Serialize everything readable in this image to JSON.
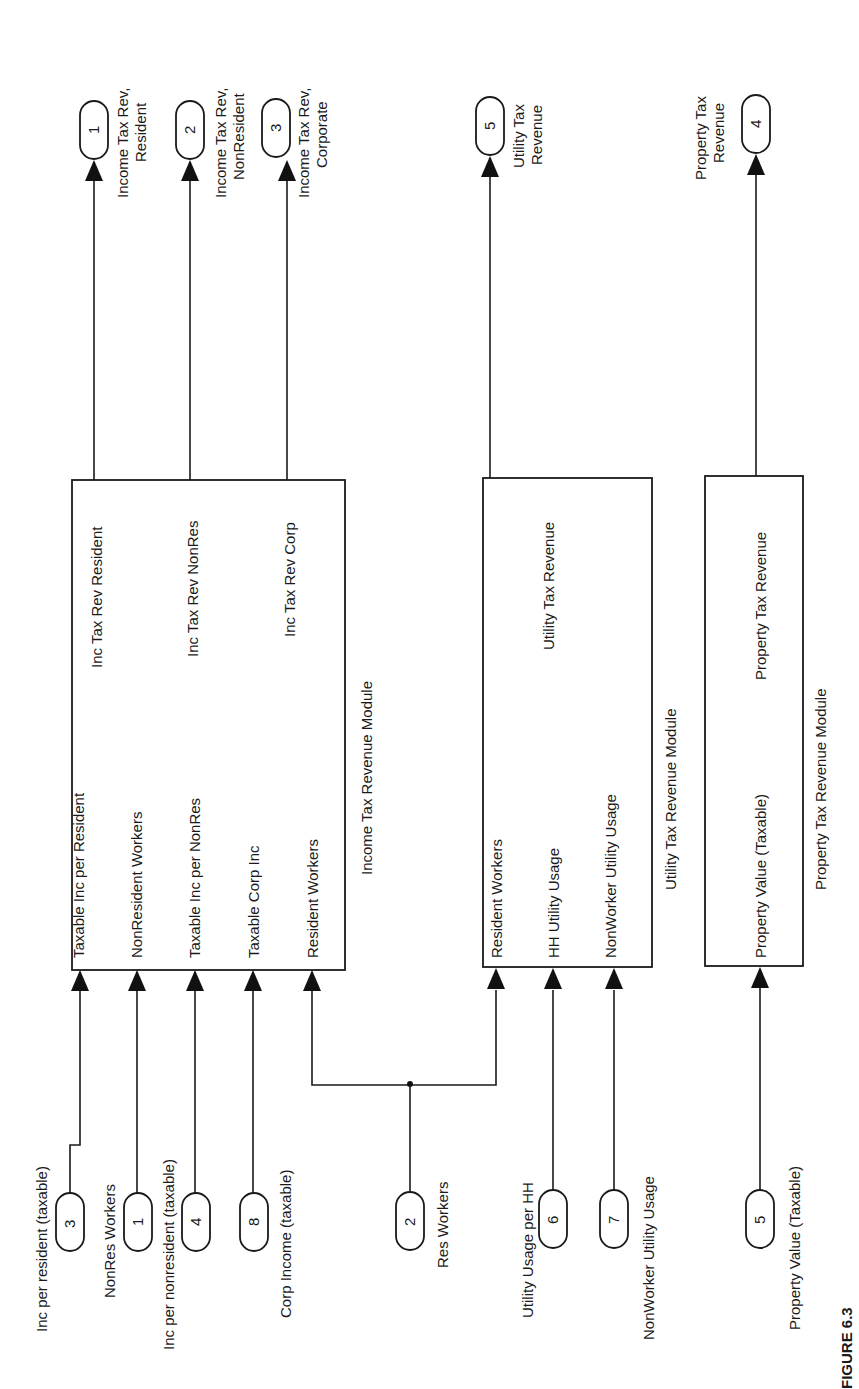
{
  "figure": {
    "caption": "FIGURE 6.3",
    "orientation": "rotated 90 degrees counterclockwise"
  },
  "inports": [
    {
      "id": "in-3",
      "number": "3",
      "label": "Inc per resident (taxable)"
    },
    {
      "id": "in-1",
      "number": "1",
      "label": "NonRes Workers"
    },
    {
      "id": "in-4",
      "number": "4",
      "label": "Inc per nonresident (taxable)"
    },
    {
      "id": "in-8",
      "number": "8",
      "label": "Corp Income (taxable)"
    },
    {
      "id": "in-2",
      "number": "2",
      "label": "Res Workers"
    },
    {
      "id": "in-6",
      "number": "6",
      "label": "Utility Usage per HH"
    },
    {
      "id": "in-7",
      "number": "7",
      "label": "NonWorker Utility Usage"
    },
    {
      "id": "in-5",
      "number": "5",
      "label": "Property Value (Taxable)"
    }
  ],
  "outports": [
    {
      "id": "out-1",
      "number": "1",
      "label_line1": "Income Tax Rev,",
      "label_line2": "Resident"
    },
    {
      "id": "out-2",
      "number": "2",
      "label_line1": "Income Tax Rev,",
      "label_line2": "NonResident"
    },
    {
      "id": "out-3",
      "number": "3",
      "label_line1": "Income Tax Rev,",
      "label_line2": "Corporate"
    },
    {
      "id": "out-5",
      "number": "5",
      "label_line1": "Utility Tax",
      "label_line2": "Revenue"
    },
    {
      "id": "out-4",
      "number": "4",
      "label_line1": "Property Tax",
      "label_line2": "Revenue"
    }
  ],
  "modules": [
    {
      "id": "income-tax",
      "name": "Income Tax Revenue Module",
      "inputs": [
        "Taxable Inc per Resident",
        "NonResident Workers",
        "Taxable Inc per NonRes",
        "Taxable Corp Inc",
        "Resident Workers"
      ],
      "outputs": [
        "Inc Tax Rev Resident",
        "Inc Tax Rev NonRes",
        "Inc Tax Rev Corp"
      ]
    },
    {
      "id": "utility-tax",
      "name": "Utility Tax Revenue Module",
      "inputs": [
        "Resident Workers",
        "HH Utility Usage",
        "NonWorker Utility Usage"
      ],
      "outputs": [
        "Utility Tax Revenue"
      ]
    },
    {
      "id": "property-tax",
      "name": "Property Tax Revenue Module",
      "inputs": [
        "Property Value (Taxable)"
      ],
      "outputs": [
        "Property Tax Revenue"
      ]
    }
  ]
}
